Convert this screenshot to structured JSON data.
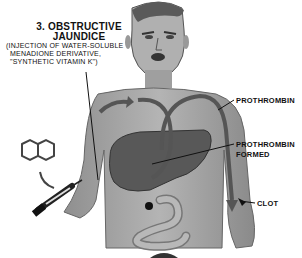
{
  "illustration": {
    "title": {
      "number": "3.",
      "line1": "3. OBSTRUCTIVE",
      "line2": "JAUNDICE"
    },
    "subtitle": {
      "line1": "(INJECTION OF WATER-SOLUBLE",
      "line2": "MENADIONE DERIVATIVE,",
      "line3": "\"SYNTHETIC VITAMIN K\")"
    },
    "labels": {
      "prothrombin": "PROTHROMBIN",
      "prothrombin_formed_line1": "PROTHROMBIN",
      "prothrombin_formed_line2": "FORMED",
      "clot": "CLOT"
    },
    "icons": [
      "naphthoquinone-ring-icon",
      "syringe-icon",
      "human-torso-figure",
      "liver-organ",
      "intestine-organ",
      "circulation-arrow-icon"
    ],
    "colors": {
      "background": "#ffffff",
      "skin": "#a9a9a9",
      "skin_dark": "#6e6e6e",
      "ink": "#111111",
      "liver": "#555555"
    }
  }
}
